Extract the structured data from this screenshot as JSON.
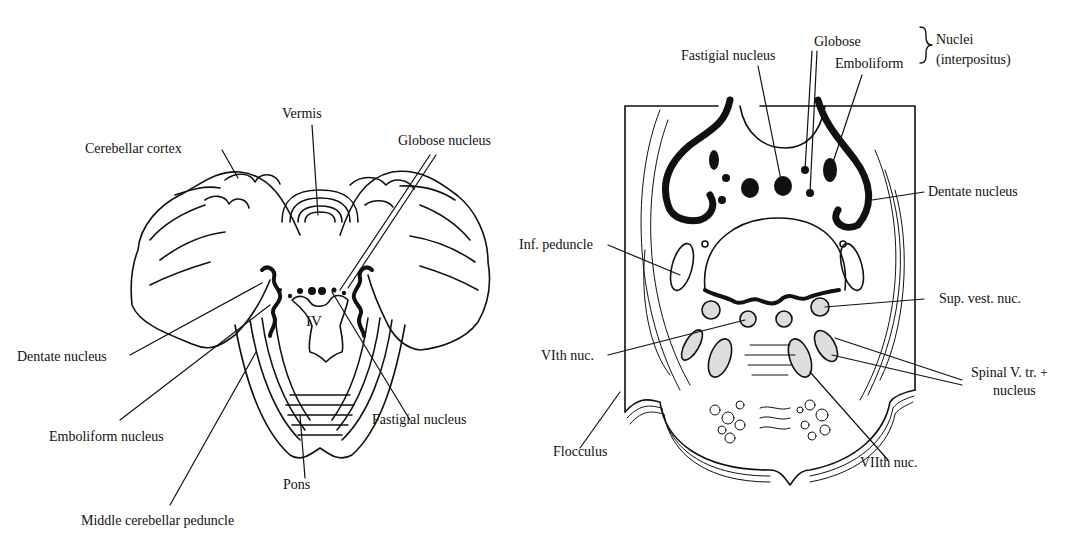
{
  "left_figure": {
    "labels": {
      "vermis": "Vermis",
      "cerebellar_cortex": "Cerebellar cortex",
      "globose_nucleus": "Globose nucleus",
      "fourth_ventricle": "IV",
      "dentate_nucleus": "Dentate nucleus",
      "emboliform_nucleus": "Emboliform nucleus",
      "fastigial_nucleus": "Fastigial nucleus",
      "pons": "Pons",
      "middle_cerebellar_peduncle": "Middle cerebellar peduncle"
    }
  },
  "right_figure": {
    "labels": {
      "fastigial_nucleus": "Fastigial nucleus",
      "globose": "Globose",
      "emboliform": "Emboliform",
      "nuclei": "Nuclei",
      "interpositus": "(interpositus)",
      "dentate_nucleus": "Dentate nucleus",
      "inf_peduncle": "Inf. peduncle",
      "sup_vest_nuc": "Sup. vest. nuc.",
      "vith_nuc": "VIth nuc.",
      "spinal_v_tr": "Spinal V. tr. +",
      "nucleus": "nucleus",
      "flocculus": "Flocculus",
      "viith_nuc": "VIIth nuc."
    }
  }
}
